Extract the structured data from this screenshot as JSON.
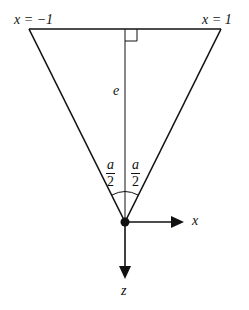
{
  "diagram": {
    "labels": {
      "left_corner": "x = −1",
      "right_corner": "x = 1",
      "height": "e",
      "x_axis": "x",
      "z_axis": "z"
    },
    "half_angle_left": {
      "numerator": "a",
      "denominator": "2"
    },
    "half_angle_right": {
      "numerator": "a",
      "denominator": "2"
    },
    "colors": {
      "stroke": "#111111",
      "background": "#ffffff"
    }
  }
}
